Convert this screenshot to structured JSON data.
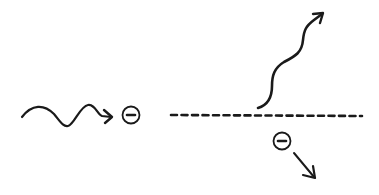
{
  "diagram": {
    "type": "compton-scattering-schematic",
    "elements": {
      "incident_photon": {
        "icon": "wavy-arrow-right",
        "color": "#1a1a1a"
      },
      "incident_electron": {
        "icon": "circled-minus",
        "symbol": "−"
      },
      "scattering_surface": {
        "style": "dashed-line"
      },
      "scattered_photon": {
        "icon": "wavy-arrow-up-right",
        "color": "#1a1a1a"
      },
      "recoil_electron": {
        "icon": "circled-minus",
        "symbol": "−"
      },
      "recoil_direction": {
        "icon": "arrow-down-right"
      }
    },
    "colors": {
      "ink": "#1a1a1a",
      "background": "#ffffff"
    }
  }
}
